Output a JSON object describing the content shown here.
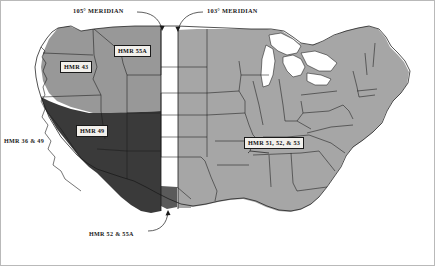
{
  "figure": {
    "kind": "map",
    "background_color": "#ffffff",
    "border_color": "#b9b9b9"
  },
  "colors": {
    "region_east_light_gray": "#a6a6a6",
    "region_northwest_medium_gray": "#989898",
    "region_southwest_dark_gray": "#3a3a3a",
    "meridian_band_white": "#ffffff",
    "outline": "#1a1a1a",
    "label_fill": "#f2f0ec",
    "label_text": "#111111"
  },
  "meridians": [
    {
      "id": "m105",
      "label": "105° MERIDIAN",
      "label_x": 72,
      "label_y": 9
    },
    {
      "id": "m103",
      "label": "103° MERIDIAN",
      "label_x": 206,
      "label_y": 9
    }
  ],
  "region_labels": [
    {
      "id": "hmr-55a",
      "text": "HMR  55A",
      "x": 113,
      "y": 44,
      "style": "boxed"
    },
    {
      "id": "hmr-43",
      "text": "HMR   43",
      "x": 59,
      "y": 60,
      "style": "boxed"
    },
    {
      "id": "hmr-49",
      "text": "HMR   49",
      "x": 75,
      "y": 124,
      "style": "boxed"
    },
    {
      "id": "hmr-36-49",
      "text": "HMR 36  &  49",
      "x": 3,
      "y": 136,
      "style": "plain"
    },
    {
      "id": "hmr-51-52-53",
      "text": "HMR 51, 52, & 53",
      "x": 243,
      "y": 136,
      "style": "boxed"
    },
    {
      "id": "hmr-52-55a",
      "text": "HMR 52  &  55A",
      "x": 88,
      "y": 229,
      "style": "plain"
    }
  ],
  "legend_summary": {
    "dark_gray_region": "HMR 49 / HMR 36 & 49 / HMR 52 & 55A (Southwest)",
    "medium_gray_region": "HMR 43 / HMR 55A (Pacific Northwest)",
    "light_gray_region": "HMR 51, 52, & 53 (East of 103° Meridian)",
    "white_band": "Transition zone between the 105° and 103° Meridians"
  }
}
